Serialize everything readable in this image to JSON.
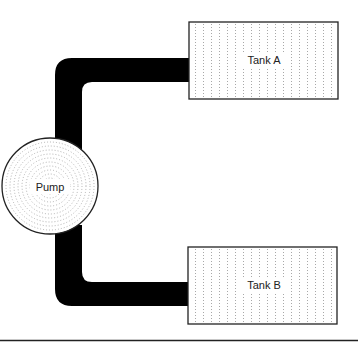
{
  "diagram": {
    "type": "flow",
    "nodes": [
      {
        "id": "pump",
        "label": "Pump",
        "shape": "circle"
      },
      {
        "id": "tankA",
        "label": "Tank A",
        "shape": "rectangle"
      },
      {
        "id": "tankB",
        "label": "Tank B",
        "shape": "rectangle"
      }
    ],
    "edges": [
      {
        "from": "pump",
        "to": "tankA",
        "style": "thick-pipe"
      },
      {
        "from": "pump",
        "to": "tankB",
        "style": "thick-pipe"
      }
    ],
    "colors": {
      "pipe": "#000000",
      "outline": "#222222",
      "fill": "#ffffff",
      "hatch": "#9a9a9a"
    }
  }
}
